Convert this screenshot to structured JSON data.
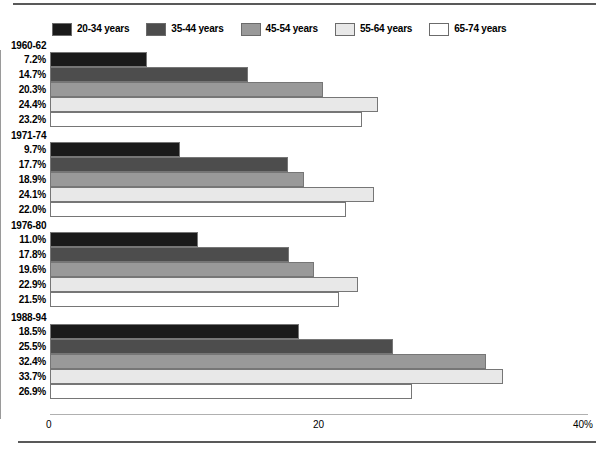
{
  "chart_data": {
    "type": "bar",
    "orientation": "horizontal",
    "title": "",
    "subtitle": "",
    "xlabel": "",
    "ylabel": "",
    "xlim": [
      0,
      40
    ],
    "xticks": [
      {
        "value": 0,
        "label": "0"
      },
      {
        "value": 20,
        "label": "20"
      },
      {
        "value": 40,
        "label": "40%"
      }
    ],
    "grid": "vertical-at-20",
    "legend_position": "top-left",
    "legend": [
      {
        "name": "20-34 years",
        "color": "#1a1a1a"
      },
      {
        "name": "35-44 years",
        "color": "#4d4d4d"
      },
      {
        "name": "45-54 years",
        "color": "#999999"
      },
      {
        "name": "55-64 years",
        "color": "#e8e8e8"
      },
      {
        "name": "65-74 years",
        "color": "#ffffff"
      }
    ],
    "categories": [
      "1960-62",
      "1971-74",
      "1976-80",
      "1988-94"
    ],
    "series": [
      {
        "name": "20-34 years",
        "color": "#1a1a1a",
        "values": [
          7.2,
          9.7,
          11.0,
          18.5
        ],
        "labels": [
          "7.2%",
          "9.7%",
          "11.0%",
          "18.5%"
        ]
      },
      {
        "name": "35-44 years",
        "color": "#4d4d4d",
        "values": [
          14.7,
          17.7,
          17.8,
          25.5
        ],
        "labels": [
          "14.7%",
          "17.7%",
          "17.8%",
          "25.5%"
        ]
      },
      {
        "name": "45-54 years",
        "color": "#999999",
        "values": [
          20.3,
          18.9,
          19.6,
          32.4
        ],
        "labels": [
          "20.3%",
          "18.9%",
          "19.6%",
          "32.4%"
        ]
      },
      {
        "name": "55-64 years",
        "color": "#e8e8e8",
        "values": [
          24.4,
          24.1,
          22.9,
          33.7
        ],
        "labels": [
          "24.4%",
          "24.1%",
          "22.9%",
          "33.7%"
        ]
      },
      {
        "name": "65-74 years",
        "color": "#ffffff",
        "values": [
          23.2,
          22.0,
          21.5,
          26.9
        ],
        "labels": [
          "23.2%",
          "22.0%",
          "21.5%",
          "26.9%"
        ]
      }
    ],
    "groups": [
      {
        "label": "1960-62",
        "bars": [
          {
            "series": "20-34 years",
            "value": 7.2,
            "label": "7.2%",
            "color": "#1a1a1a"
          },
          {
            "series": "35-44 years",
            "value": 14.7,
            "label": "14.7%",
            "color": "#4d4d4d"
          },
          {
            "series": "45-54 years",
            "value": 20.3,
            "label": "20.3%",
            "color": "#999999"
          },
          {
            "series": "55-64 years",
            "value": 24.4,
            "label": "24.4%",
            "color": "#e8e8e8"
          },
          {
            "series": "65-74 years",
            "value": 23.2,
            "label": "23.2%",
            "color": "#ffffff"
          }
        ]
      },
      {
        "label": "1971-74",
        "bars": [
          {
            "series": "20-34 years",
            "value": 9.7,
            "label": "9.7%",
            "color": "#1a1a1a"
          },
          {
            "series": "35-44 years",
            "value": 17.7,
            "label": "17.7%",
            "color": "#4d4d4d"
          },
          {
            "series": "45-54 years",
            "value": 18.9,
            "label": "18.9%",
            "color": "#999999"
          },
          {
            "series": "55-64 years",
            "value": 24.1,
            "label": "24.1%",
            "color": "#e8e8e8"
          },
          {
            "series": "65-74 years",
            "value": 22.0,
            "label": "22.0%",
            "color": "#ffffff"
          }
        ]
      },
      {
        "label": "1976-80",
        "bars": [
          {
            "series": "20-34 years",
            "value": 11.0,
            "label": "11.0%",
            "color": "#1a1a1a"
          },
          {
            "series": "35-44 years",
            "value": 17.8,
            "label": "17.8%",
            "color": "#4d4d4d"
          },
          {
            "series": "45-54 years",
            "value": 19.6,
            "label": "19.6%",
            "color": "#999999"
          },
          {
            "series": "55-64 years",
            "value": 22.9,
            "label": "22.9%",
            "color": "#e8e8e8"
          },
          {
            "series": "65-74 years",
            "value": 21.5,
            "label": "21.5%",
            "color": "#ffffff"
          }
        ]
      },
      {
        "label": "1988-94",
        "bars": [
          {
            "series": "20-34 years",
            "value": 18.5,
            "label": "18.5%",
            "color": "#1a1a1a"
          },
          {
            "series": "35-44 years",
            "value": 25.5,
            "label": "25.5%",
            "color": "#4d4d4d"
          },
          {
            "series": "45-54 years",
            "value": 32.4,
            "label": "32.4%",
            "color": "#999999"
          },
          {
            "series": "55-64 years",
            "value": 33.7,
            "label": "33.7%",
            "color": "#e8e8e8"
          },
          {
            "series": "65-74 years",
            "value": 26.9,
            "label": "26.9%",
            "color": "#ffffff"
          }
        ]
      }
    ]
  },
  "layout": {
    "axis_x0_px": 50,
    "axis_x_max_px": 588,
    "gridline_value": 20,
    "plot_top_px": 50,
    "group_top_px": [
      52,
      142,
      232,
      324
    ],
    "bar_height_px": 15,
    "bar_gap_px": 0,
    "group_gap_px": 15
  }
}
